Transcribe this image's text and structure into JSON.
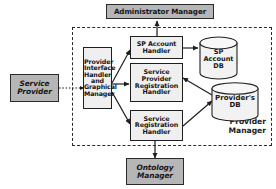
{
  "diagram": {
    "boundary": {
      "label_line1": "Provider",
      "label_line2": "Manager",
      "style": "dashed"
    },
    "external_actors": [
      {
        "id": "administrator-manager",
        "label": "Administrator Manager",
        "lines": [
          "Administrator Manager"
        ],
        "style": "shaded",
        "italic": false
      },
      {
        "id": "service-provider",
        "label": "Service Provider",
        "lines": [
          "Service",
          "Provider"
        ],
        "style": "shaded",
        "italic": true
      },
      {
        "id": "ontology-manager",
        "label": "Ontology Manager",
        "lines": [
          "Ontology",
          "Manager"
        ],
        "style": "shaded",
        "italic": true
      }
    ],
    "components": [
      {
        "id": "provider-interface-handler",
        "label": "Provider Interface Handler and Graphical Manager",
        "lines": [
          "Provider",
          "Interface",
          "Handler",
          "and",
          "Graphical",
          "Manager"
        ]
      },
      {
        "id": "sp-account-handler",
        "label": "SP Account Handler",
        "lines": [
          "SP Account",
          "Handler"
        ]
      },
      {
        "id": "service-provider-registration-handler",
        "label": "Service Provider Registration Handler",
        "lines": [
          "Service",
          "Provider",
          "Registration",
          "Handler"
        ]
      },
      {
        "id": "service-registration-handler",
        "label": "Service Registration Handler",
        "lines": [
          "Service",
          "Registration",
          "Handler"
        ]
      }
    ],
    "databases": [
      {
        "id": "sp-account-db",
        "label": "SP Account DB",
        "lines": [
          "SP",
          "Account",
          "DB"
        ]
      },
      {
        "id": "providers-db",
        "label": "Provider's DB",
        "lines": [
          "Provider's",
          "DB"
        ]
      }
    ],
    "connections": [
      {
        "from": "sp-account-handler",
        "to": "administrator-manager",
        "kind": "bidirectional",
        "line": "solid"
      },
      {
        "from": "service-provider",
        "to": "provider-interface-handler",
        "kind": "bidirectional",
        "line": "dotted"
      },
      {
        "from": "provider-interface-handler",
        "to": "sp-account-handler",
        "kind": "unidirectional",
        "line": "solid"
      },
      {
        "from": "provider-interface-handler",
        "to": "service-provider-registration-handler",
        "kind": "unidirectional",
        "line": "solid"
      },
      {
        "from": "provider-interface-handler",
        "to": "service-registration-handler",
        "kind": "unidirectional",
        "line": "solid"
      },
      {
        "from": "sp-account-handler",
        "to": "sp-account-db",
        "kind": "unidirectional",
        "line": "solid"
      },
      {
        "from": "providers-db",
        "to": "service-provider-registration-handler",
        "kind": "unidirectional",
        "line": "solid"
      },
      {
        "from": "service-registration-handler",
        "to": "providers-db",
        "kind": "bidirectional",
        "line": "solid"
      },
      {
        "from": "service-registration-handler",
        "to": "ontology-manager",
        "kind": "bidirectional",
        "line": "solid"
      }
    ],
    "colors": {
      "actor_fill": "#b6b6b6",
      "component_fill": "#efefef",
      "db_fill": "#f2f2f2",
      "stroke": "#1f1f1f",
      "boundary_stroke": "#2b2b2b",
      "background": "#ffffff"
    }
  }
}
